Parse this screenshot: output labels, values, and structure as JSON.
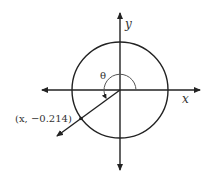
{
  "diagram": {
    "type": "unit-circle",
    "axes": {
      "x_label": "x",
      "y_label": "y"
    },
    "angle_label": "θ",
    "point_label": "(x, −0.214)",
    "point": {
      "x": "x",
      "y": -0.214
    },
    "colors": {
      "stroke": "#222222",
      "text": "#333333",
      "arc": "#555555"
    }
  }
}
